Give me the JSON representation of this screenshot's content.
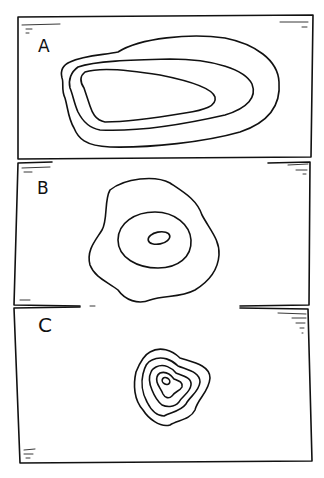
{
  "diagram": {
    "panels": [
      {
        "label": "A",
        "description": "Elongated set of three nested contour lines, widely spaced"
      },
      {
        "label": "B",
        "description": "Irregular outer contour with two inner concentric contours, widely spaced"
      },
      {
        "label": "C",
        "description": "Small tightly packed set of five nested contour lines"
      }
    ]
  }
}
